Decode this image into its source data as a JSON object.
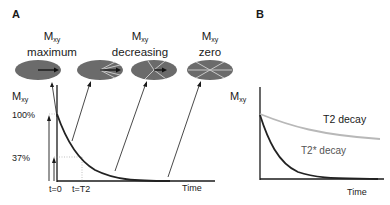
{
  "panels": {
    "a": {
      "letter": "A",
      "states": [
        {
          "symbol": "M",
          "subscript": "xy",
          "caption": "maximum"
        },
        {
          "symbol": "M",
          "subscript": "xy",
          "caption": "decreasing"
        },
        {
          "symbol": "M",
          "subscript": "xy",
          "caption": "zero"
        }
      ],
      "yaxis": {
        "symbol": "M",
        "subscript": "xy"
      },
      "yticks": [
        "100%",
        "37%"
      ],
      "xticks": [
        "t=0",
        "t=T2"
      ],
      "xlabel": "Time"
    },
    "b": {
      "letter": "B",
      "yaxis": {
        "symbol": "M",
        "subscript": "xy"
      },
      "curves": [
        {
          "label": "T2 decay",
          "color": "#b8b8b8"
        },
        {
          "label": "T2* decay",
          "color": "#222222"
        }
      ],
      "xlabel": "Time"
    }
  },
  "colors": {
    "disc": "#6b6b6b",
    "disc_lines": "#c8c8c8",
    "curve": "#222222",
    "axis": "#1a1a1a",
    "t2_curve": "#b8b8b8"
  }
}
